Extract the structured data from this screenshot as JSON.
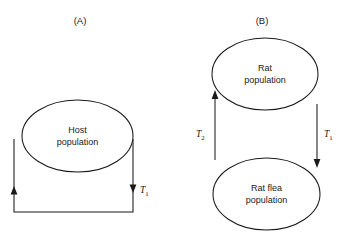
{
  "figure": {
    "background_color": "#ffffff",
    "line_color": "#1a1a1a",
    "panels": [
      {
        "caption": "(A)",
        "nodes": [
          {
            "id": "host",
            "line1": "Host",
            "line2": "population"
          }
        ],
        "flows": [
          {
            "id": "t1",
            "label": "T",
            "subscript": "1"
          }
        ]
      },
      {
        "caption": "(B)",
        "nodes": [
          {
            "id": "rat",
            "line1": "Rat",
            "line2": "population"
          },
          {
            "id": "ratflea",
            "line1": "Rat flea",
            "line2": "population"
          }
        ],
        "flows": [
          {
            "id": "t2",
            "label": "T",
            "subscript": "2"
          },
          {
            "id": "t1",
            "label": "T",
            "subscript": "1"
          }
        ]
      }
    ]
  }
}
